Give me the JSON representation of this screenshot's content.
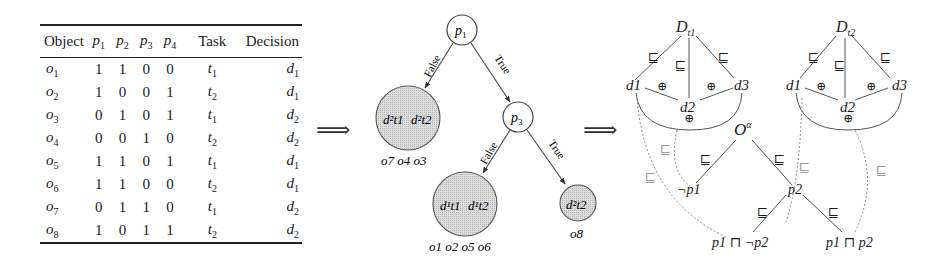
{
  "table": {
    "headers": {
      "object": "Object",
      "p1": "p",
      "p1_sub": "1",
      "p2": "p",
      "p2_sub": "2",
      "p3": "p",
      "p3_sub": "3",
      "p4": "p",
      "p4_sub": "4",
      "task": "Task",
      "decision": "Decision"
    },
    "rows": [
      {
        "obj": "o",
        "obj_sub": "1",
        "p1": "1",
        "p2": "1",
        "p3": "0",
        "p4": "0",
        "task": "t",
        "task_sub": "1",
        "dec": "d",
        "dec_sub": "1"
      },
      {
        "obj": "o",
        "obj_sub": "2",
        "p1": "1",
        "p2": "0",
        "p3": "0",
        "p4": "1",
        "task": "t",
        "task_sub": "2",
        "dec": "d",
        "dec_sub": "1"
      },
      {
        "obj": "o",
        "obj_sub": "3",
        "p1": "0",
        "p2": "1",
        "p3": "0",
        "p4": "1",
        "task": "t",
        "task_sub": "1",
        "dec": "d",
        "dec_sub": "2"
      },
      {
        "obj": "o",
        "obj_sub": "4",
        "p1": "0",
        "p2": "0",
        "p3": "1",
        "p4": "0",
        "task": "t",
        "task_sub": "2",
        "dec": "d",
        "dec_sub": "2"
      },
      {
        "obj": "o",
        "obj_sub": "5",
        "p1": "1",
        "p2": "1",
        "p3": "0",
        "p4": "1",
        "task": "t",
        "task_sub": "1",
        "dec": "d",
        "dec_sub": "1"
      },
      {
        "obj": "o",
        "obj_sub": "6",
        "p1": "1",
        "p2": "1",
        "p3": "0",
        "p4": "0",
        "task": "t",
        "task_sub": "2",
        "dec": "d",
        "dec_sub": "1"
      },
      {
        "obj": "o",
        "obj_sub": "7",
        "p1": "0",
        "p2": "1",
        "p3": "1",
        "p4": "0",
        "task": "t",
        "task_sub": "1",
        "dec": "d",
        "dec_sub": "2"
      },
      {
        "obj": "o",
        "obj_sub": "8",
        "p1": "1",
        "p2": "0",
        "p3": "1",
        "p4": "1",
        "task": "t",
        "task_sub": "2",
        "dec": "d",
        "dec_sub": "2"
      }
    ]
  },
  "arrows": {
    "implies_1": "⟹",
    "implies_2": "⟹"
  },
  "decision_tree": {
    "root": {
      "label": "p",
      "sub": "1"
    },
    "edge_false_1": "False",
    "edge_true_1": "True",
    "inner": {
      "label": "p",
      "sub": "3"
    },
    "edge_false_2": "False",
    "edge_true_2": "True",
    "leaf_left": {
      "content_a": "d²t1",
      "content_b": "d²t2",
      "objects": "o7 o4 o3"
    },
    "leaf_mid": {
      "content_a": "d¹t1",
      "content_b": "d¹t2",
      "objects": "o1 o2 o5 o6"
    },
    "leaf_right": {
      "content_a": "d²t2",
      "objects": "o8"
    }
  },
  "ontology": {
    "decision_space_1": {
      "label": "D",
      "sub": "t1",
      "nodes": [
        "d1",
        "d2",
        "d3"
      ]
    },
    "decision_space_2": {
      "label": "D",
      "sub": "t2",
      "nodes": [
        "d1",
        "d2",
        "d3"
      ]
    },
    "exclusive_symbol": "⊕",
    "subsumes_symbol": "⊑",
    "root": {
      "label": "O",
      "sup": "α"
    },
    "neg_p1": "¬p1",
    "p2": "p2",
    "p1_and_not_p2": "p1 ⊓ ¬p2",
    "p1_and_p2": "p1 ⊓ p2"
  },
  "colors": {
    "line": "#3a3a3a",
    "leaf_fill": "#d6d6d6",
    "dotted": "#8a8a8a"
  }
}
